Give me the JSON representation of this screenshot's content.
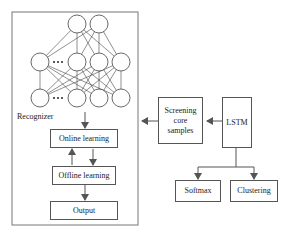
{
  "diagram": {
    "recognizer": {
      "label": "Recognizer",
      "nodes": {
        "online": "Online learning",
        "offline": "Offline learning",
        "output": "Output"
      },
      "network": {
        "top_layer_nodes": 2,
        "middle_layer_nodes": 4,
        "bottom_layer_nodes": 4,
        "ellipsis": "•••"
      }
    },
    "screening": "Screening\ncore\nsamples",
    "lstm": "LSTM",
    "softmax": "Softmax",
    "clustering": "Clustering"
  }
}
